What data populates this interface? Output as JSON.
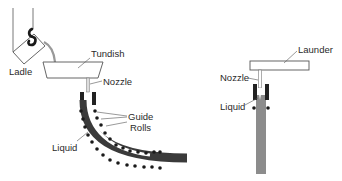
{
  "left_diagram": {
    "labels": {
      "ladle": "Ladle",
      "tundish": "Tundish",
      "nozzle": "Nozzle",
      "guide": "Guide",
      "rolls": "Rolls",
      "liquid": "Liquid"
    }
  },
  "right_diagram": {
    "labels": {
      "launder": "Launder",
      "nozzle": "Nozzle",
      "liquid": "Liquid"
    }
  },
  "colors": {
    "line": "#555555",
    "dark": "#222222",
    "strand": "#444444",
    "strand_light": "#8c8c8c",
    "liquid": "#ffffff"
  }
}
